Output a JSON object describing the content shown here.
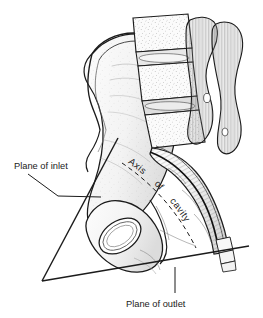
{
  "figure": {
    "background_color": "#ffffff",
    "ink_color": "#1b1b1b",
    "shade_color": "#6f6f6f",
    "width": 263,
    "height": 318
  },
  "labels": {
    "plane_of_inlet": "Plane of inlet",
    "plane_of_outlet": "Plane of outlet",
    "axis_word_1": "Axis",
    "axis_word_2": "of",
    "axis_word_3": "cavity"
  },
  "annotations": [
    {
      "name": "plane-of-inlet",
      "text": "Plane of inlet",
      "text_x": 14,
      "text_y": 169,
      "leader": "M28,174 L58,196 L101,197",
      "style": "solid"
    },
    {
      "name": "plane-of-outlet",
      "text": "Plane of outlet",
      "text_x": 126,
      "text_y": 307,
      "leader": "M175,268 L175,293",
      "style": "solid"
    },
    {
      "name": "axis-of-cavity",
      "text": "Axis of cavity",
      "path": "M122,163 C150,182 176,208 196,248",
      "style": "dashed"
    }
  ],
  "planes": [
    {
      "name": "inlet-plane-line",
      "label": "Plane of inlet",
      "from_x": 118,
      "from_y": 138,
      "to_x": 42,
      "to_y": 281
    },
    {
      "name": "outlet-plane-line",
      "label": "Plane of outlet",
      "from_x": 42,
      "from_y": 281,
      "to_x": 249,
      "to_y": 246
    }
  ],
  "structures": [
    {
      "name": "lumbar-vertebra-upper",
      "label": "Lumbar vertebra"
    },
    {
      "name": "intervertebral-disc",
      "label": "Intervertebral disc"
    },
    {
      "name": "lumbar-vertebra-lower",
      "label": "Lumbar vertebra"
    },
    {
      "name": "sacrum",
      "label": "Sacrum"
    },
    {
      "name": "coccyx",
      "label": "Coccyx"
    },
    {
      "name": "ilium",
      "label": "Ilium"
    },
    {
      "name": "iliac-crest",
      "label": "Iliac crest"
    },
    {
      "name": "obturator-foramen",
      "label": "Obturator foramen"
    },
    {
      "name": "pubis",
      "label": "Pubis"
    },
    {
      "name": "ischium",
      "label": "Ischium"
    },
    {
      "name": "sacral-canal",
      "label": "Sacral canal"
    }
  ]
}
